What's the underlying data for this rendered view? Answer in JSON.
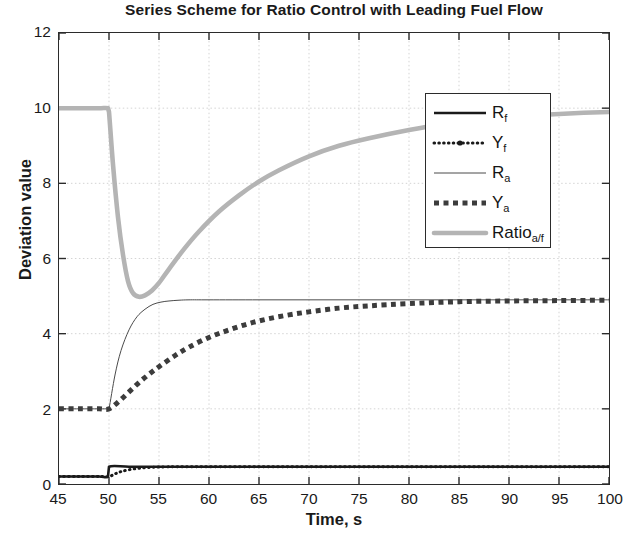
{
  "chart_data": {
    "type": "line",
    "title": "Series Scheme for Ratio Control with Leading Fuel Flow",
    "xlabel": "Time, s",
    "ylabel": "Deviation value",
    "xlim": [
      45,
      100
    ],
    "ylim": [
      0,
      12
    ],
    "xticks": [
      45,
      50,
      55,
      60,
      65,
      70,
      75,
      80,
      85,
      90,
      95,
      100
    ],
    "yticks": [
      0,
      2,
      4,
      6,
      8,
      10,
      12
    ],
    "grid": true,
    "legend_position": "center right",
    "series": [
      {
        "name": "R_f",
        "label": "R",
        "sub": "f",
        "style": "solid-thick",
        "color": "#1a1a1a",
        "x": [
          45,
          47,
          49,
          49.9,
          50,
          52,
          55,
          60,
          65,
          70,
          75,
          80,
          85,
          90,
          95,
          100
        ],
        "values": [
          0.2,
          0.2,
          0.2,
          0.2,
          0.46,
          0.46,
          0.46,
          0.46,
          0.46,
          0.46,
          0.46,
          0.46,
          0.46,
          0.46,
          0.46,
          0.46
        ]
      },
      {
        "name": "Y_f",
        "label": "Y",
        "sub": "f",
        "style": "dotted-marker",
        "color": "#1a1a1a",
        "x": [
          45,
          47,
          49,
          50,
          50.6,
          51.2,
          52,
          53,
          54,
          55,
          57,
          60,
          65,
          70,
          75,
          80,
          85,
          90,
          95,
          100
        ],
        "values": [
          0.2,
          0.2,
          0.2,
          0.2,
          0.27,
          0.33,
          0.38,
          0.42,
          0.44,
          0.45,
          0.46,
          0.46,
          0.46,
          0.46,
          0.46,
          0.46,
          0.46,
          0.46,
          0.46,
          0.46
        ]
      },
      {
        "name": "R_a",
        "label": "R",
        "sub": "a",
        "style": "solid-thin",
        "color": "#4a4a4a",
        "x": [
          45,
          47,
          49,
          49.9,
          50,
          50.6,
          51.2,
          52,
          52.8,
          53.6,
          54.4,
          55.2,
          56,
          57,
          58,
          60,
          65,
          70,
          75,
          80,
          85,
          90,
          95,
          100
        ],
        "values": [
          2.0,
          2.0,
          2.0,
          2.0,
          2.0,
          2.9,
          3.55,
          4.1,
          4.45,
          4.65,
          4.78,
          4.84,
          4.87,
          4.89,
          4.9,
          4.9,
          4.9,
          4.9,
          4.9,
          4.9,
          4.9,
          4.9,
          4.9,
          4.9
        ]
      },
      {
        "name": "Y_a",
        "label": "Y",
        "sub": "a",
        "style": "dashed-thick",
        "color": "#3c3c3c",
        "x": [
          45,
          47,
          49,
          50,
          51,
          52,
          53,
          54,
          55,
          56.5,
          58,
          60,
          62,
          64,
          66,
          68,
          70,
          73,
          76,
          80,
          85,
          90,
          95,
          100
        ],
        "values": [
          2.0,
          2.0,
          2.0,
          2.0,
          2.2,
          2.45,
          2.7,
          2.92,
          3.12,
          3.4,
          3.64,
          3.9,
          4.1,
          4.27,
          4.4,
          4.5,
          4.58,
          4.68,
          4.74,
          4.8,
          4.85,
          4.87,
          4.88,
          4.89
        ]
      },
      {
        "name": "Ratio_a/f",
        "label": "Ratio",
        "sub": "a/f",
        "style": "solid-thick-gray",
        "color": "#b4b4b4",
        "x": [
          45,
          47,
          49,
          49.9,
          50,
          50.4,
          50.9,
          51.4,
          51.9,
          52.4,
          53,
          53.6,
          54.3,
          55,
          56,
          57.5,
          59,
          61,
          63,
          65,
          67,
          70,
          73,
          76,
          80,
          84,
          88,
          92,
          96,
          100
        ],
        "values": [
          10.0,
          10.0,
          10.0,
          10.0,
          9.9,
          8.5,
          7.1,
          6.1,
          5.4,
          5.08,
          4.98,
          5.02,
          5.15,
          5.35,
          5.72,
          6.25,
          6.72,
          7.25,
          7.68,
          8.05,
          8.35,
          8.72,
          9.0,
          9.2,
          9.42,
          9.6,
          9.72,
          9.8,
          9.86,
          9.9
        ]
      }
    ]
  },
  "axes": {
    "title": "Series Scheme for Ratio Control with Leading Fuel Flow",
    "xlabel": "Time, s",
    "ylabel": "Deviation value",
    "xticks": [
      "45",
      "50",
      "55",
      "60",
      "65",
      "70",
      "75",
      "80",
      "85",
      "90",
      "95",
      "100"
    ],
    "yticks": [
      "0",
      "2",
      "4",
      "6",
      "8",
      "10",
      "12"
    ]
  },
  "legend": {
    "entries": [
      {
        "label": "R",
        "sub": "f",
        "name": "R_f"
      },
      {
        "label": "Y",
        "sub": "f",
        "name": "Y_f"
      },
      {
        "label": "R",
        "sub": "a",
        "name": "R_a"
      },
      {
        "label": "Y",
        "sub": "a",
        "name": "Y_a"
      },
      {
        "label": "Ratio",
        "sub": "a/f",
        "name": "Ratio_a/f"
      }
    ]
  },
  "colors": {
    "axis": "#2b2b2b",
    "grid": "#cfcfcf",
    "text": "#1a1a1a",
    "ratio_series": "#b4b4b4",
    "dark_series": "#1a1a1a",
    "thin_series": "#4a4a4a",
    "background": "#ffffff"
  }
}
